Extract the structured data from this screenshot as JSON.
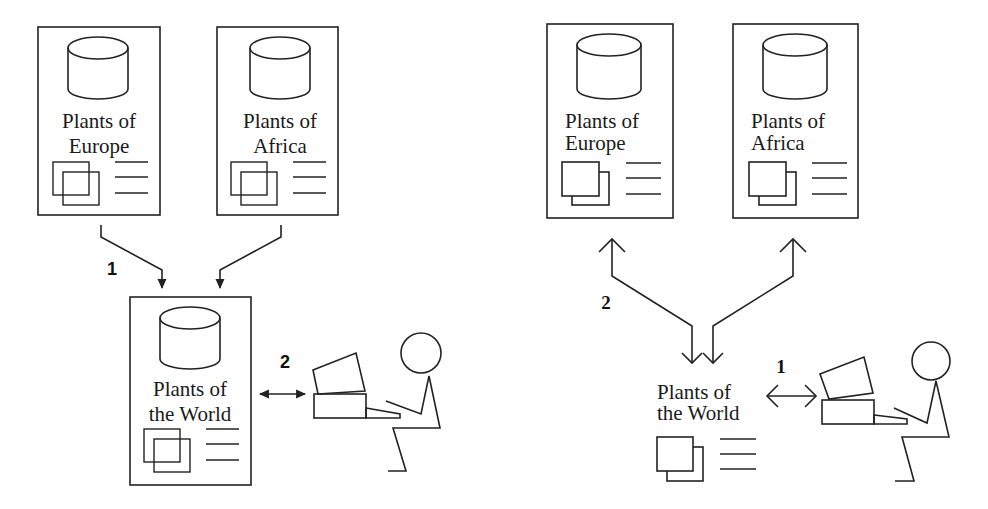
{
  "diagram": {
    "left_panel": {
      "title": "Centralized aggregation model",
      "sources": [
        {
          "line1": "Plants of",
          "line2": "Europe"
        },
        {
          "line1": "Plants of",
          "line2": "Africa"
        }
      ],
      "aggregate": {
        "line1": "Plants of",
        "line2": "the World"
      },
      "step_labels": {
        "ingest": "1",
        "query": "2"
      }
    },
    "right_panel": {
      "title": "Federated query model",
      "sources": [
        {
          "line1": "Plants of",
          "line2": "Europe"
        },
        {
          "line1": "Plants of",
          "line2": "Africa"
        }
      ],
      "portal": {
        "line1": "Plants of",
        "line2": "the World"
      },
      "step_labels": {
        "query": "1",
        "fanout": "2"
      }
    },
    "colors": {
      "stroke": "#222222",
      "background": "#ffffff"
    }
  }
}
